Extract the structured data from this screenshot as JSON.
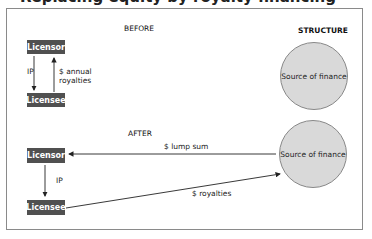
{
  "title": "Replacing equity by royalty financing",
  "headers": {
    "before": "BEFORE",
    "after": "AFTER",
    "structure": "STRUCTURE"
  },
  "before": {
    "licensor": "Licensor",
    "licensee": "Licensee",
    "ip_label": "IP",
    "royalties_label_1": "$ annual",
    "royalties_label_2": "royalties"
  },
  "after": {
    "licensor": "Licensor",
    "licensee": "Licensee",
    "ip_label": "IP",
    "lump_sum_label": "$ lump sum",
    "royalties_label": "$ royalties"
  },
  "circles": {
    "top": "Source of finance",
    "bottom": "Source of finance"
  },
  "colors": {
    "box": "#505050",
    "circle_fill": "#d9d9d9",
    "frame": "#8a8a8a"
  }
}
